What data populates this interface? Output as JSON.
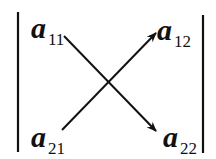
{
  "diagram": {
    "type": "determinant-cross-multiplication",
    "stroke_color": "#111111",
    "background": "#ffffff",
    "terms": {
      "a11": {
        "base": "a",
        "sub": "11"
      },
      "a12": {
        "base": "a",
        "sub": "12"
      },
      "a21": {
        "base": "a",
        "sub": "21"
      },
      "a22": {
        "base": "a",
        "sub": "22"
      }
    },
    "arrows": [
      {
        "from": "a11",
        "to": "a22",
        "direction": "down-right"
      },
      {
        "from": "a21",
        "to": "a12",
        "direction": "up-right"
      }
    ]
  }
}
